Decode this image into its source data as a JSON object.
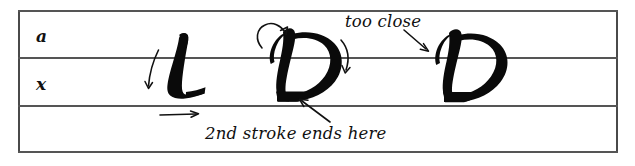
{
  "figure": {
    "kind": "calligraphy-guideline-diagram",
    "background_color": "#ffffff",
    "ink_color": "#0a0a0a",
    "rule_color": "#555555",
    "border_color": "#4a4a4a"
  },
  "guidelines": {
    "zones": [
      {
        "id": "ascender-zone",
        "label": "a"
      },
      {
        "id": "x-height-zone",
        "label": "x"
      },
      {
        "id": "descender-zone",
        "label": ""
      }
    ],
    "lines": [
      {
        "id": "top-line",
        "name": "top"
      },
      {
        "id": "ascender-line",
        "name": "ascender"
      },
      {
        "id": "baseline",
        "name": "baseline"
      },
      {
        "id": "bottom-line",
        "name": "bottom"
      }
    ]
  },
  "specimens": [
    {
      "id": "specimen-l",
      "letter": "L",
      "style": "blackletter-capital"
    },
    {
      "id": "specimen-d-annotated",
      "letter": "D",
      "style": "blackletter-capital"
    },
    {
      "id": "specimen-d-plain",
      "letter": "D",
      "style": "blackletter-capital"
    }
  ],
  "annotations": {
    "too_close": "too close",
    "second_stroke": "2nd stroke ends here"
  },
  "stroke_marks": [
    {
      "id": "l-entry-arrow",
      "direction": "down-left",
      "target": "specimen-l"
    },
    {
      "id": "l-exit-arrow",
      "direction": "right",
      "target": "specimen-l"
    },
    {
      "id": "d-loop-arrow",
      "direction": "up-curve",
      "target": "specimen-d-annotated"
    },
    {
      "id": "d-down-arrow",
      "direction": "down-curve",
      "target": "specimen-d-annotated"
    },
    {
      "id": "second-stroke-pointer",
      "direction": "up-left",
      "target": "specimen-d-annotated"
    },
    {
      "id": "too-close-pointer",
      "direction": "down-right",
      "target": "specimen-d-plain"
    }
  ]
}
